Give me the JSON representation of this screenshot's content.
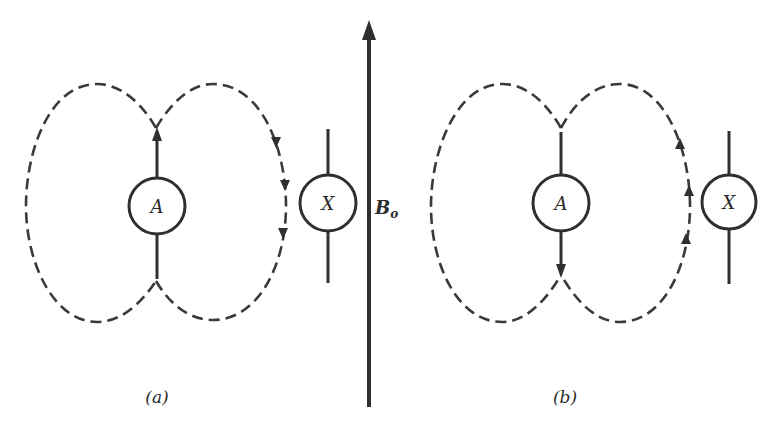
{
  "figure": {
    "field_label": "B",
    "field_subscript": "o",
    "panels": [
      {
        "id": "a",
        "caption": "(a)",
        "source_label": "A",
        "target_label": "X",
        "dipole_direction": "up",
        "field_line_direction_at_target": "down"
      },
      {
        "id": "b",
        "caption": "(b)",
        "source_label": "A",
        "target_label": "X",
        "dipole_direction": "down",
        "field_line_direction_at_target": "up"
      }
    ],
    "colors": {
      "ink": "#2f2f2f",
      "background": "#ffffff"
    }
  }
}
